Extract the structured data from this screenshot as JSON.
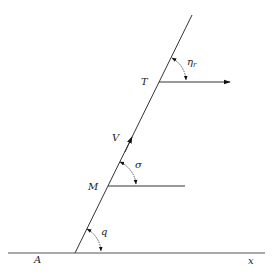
{
  "diagram": {
    "labels": {
      "A": "A",
      "x": "x",
      "M": "M",
      "T": "T",
      "V": "V",
      "q": "q",
      "sigma": "σ",
      "eta": "η",
      "eta_sub": "r"
    },
    "colors": {
      "line": "#333333",
      "baseline": "#555555",
      "background": "#ffffff"
    }
  }
}
